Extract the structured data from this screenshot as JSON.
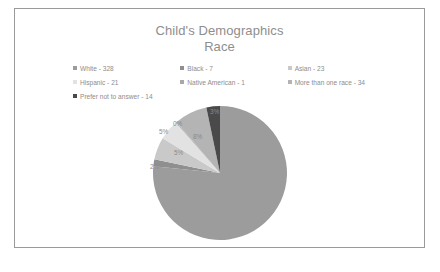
{
  "frame": {
    "border_color": "#9a9a9a",
    "background": "#ffffff"
  },
  "title": {
    "line1": "Child's Demographics",
    "line2": "Race",
    "color": "#8e8e8e"
  },
  "legend": {
    "rows": [
      [
        {
          "label": "White - 328",
          "color": "#9c9c9c"
        },
        {
          "label": "Black - 7",
          "color": "#8f8f8f"
        },
        {
          "label": "Asian - 23",
          "color": "#c9c9c9"
        }
      ],
      [
        {
          "label": "Hispanic - 21",
          "color": "#e2e2e2"
        },
        {
          "label": "Native American - 1",
          "color": "#a8a8a8"
        },
        {
          "label": "More than one race - 34",
          "color": "#b4b4b4"
        }
      ],
      [
        {
          "label": "Prefer not to answer - 14",
          "color": "#4a4a4a"
        }
      ]
    ]
  },
  "chart_data": {
    "type": "pie",
    "title": "Child's Demographics Race",
    "categories": [
      "White",
      "Black",
      "Asian",
      "Hispanic",
      "Native American",
      "More than one race",
      "Prefer not to answer"
    ],
    "values": [
      328,
      7,
      23,
      21,
      1,
      34,
      14
    ],
    "total": 428,
    "percent_labels": [
      "77%",
      "2%",
      "5%",
      "5%",
      "0%",
      "8%",
      "3%"
    ],
    "colors": [
      "#9c9c9c",
      "#8f8f8f",
      "#c9c9c9",
      "#e2e2e2",
      "#a8a8a8",
      "#b4b4b4",
      "#4a4a4a"
    ],
    "legend_position": "top",
    "grid": false,
    "label_color": "#8b8b8b"
  },
  "slice_labels": {
    "white": "77%",
    "black": "2%",
    "asian": "5%",
    "hispanic": "5%",
    "native_american": "0%",
    "more_than_one_race": "8%",
    "prefer_not_to_answer": "3%"
  }
}
